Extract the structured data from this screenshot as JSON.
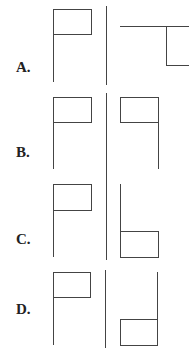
{
  "options": [
    {
      "label": "A.",
      "label_pos": [
        16,
        45
      ]
    },
    {
      "label": "B.",
      "label_pos": [
        16,
        131
      ]
    },
    {
      "label": "C.",
      "label_pos": [
        16,
        216
      ]
    },
    {
      "label": "D.",
      "label_pos": [
        16,
        306
      ]
    }
  ],
  "colors": {
    "stroke": "#444444",
    "text": "#222222",
    "background": "#ffffff"
  }
}
